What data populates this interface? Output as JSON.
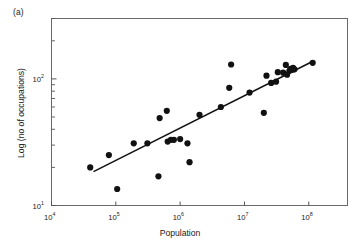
{
  "figure": {
    "panel_label": "(a)"
  },
  "chart_data": {
    "type": "scatter",
    "title": "",
    "xlabel": "Population",
    "ylabel": "Log (no of occupations)",
    "xscale": "log",
    "yscale": "log",
    "xlim": [
      10000,
      400000000
    ],
    "ylim": [
      10,
      300
    ],
    "grid": false,
    "legend": null,
    "xticks": [
      {
        "value": 10000,
        "mantissa": "10",
        "exponent": "4",
        "label": "10^4"
      },
      {
        "value": 100000,
        "mantissa": "10",
        "exponent": "5",
        "label": "10^5"
      },
      {
        "value": 1000000,
        "mantissa": "10",
        "exponent": "6",
        "label": "10^6"
      },
      {
        "value": 10000000,
        "mantissa": "10",
        "exponent": "7",
        "label": "10^7"
      },
      {
        "value": 100000000,
        "mantissa": "10",
        "exponent": "8",
        "label": "10^8"
      }
    ],
    "yticks": [
      {
        "value": 10,
        "mantissa": "10",
        "exponent": "1",
        "label": "10^1"
      },
      {
        "value": 100,
        "mantissa": "10",
        "exponent": "2",
        "label": "10^2"
      }
    ],
    "points": [
      {
        "x": 40000,
        "y": 20
      },
      {
        "x": 78000,
        "y": 25
      },
      {
        "x": 105000,
        "y": 13.5
      },
      {
        "x": 190000,
        "y": 31
      },
      {
        "x": 310000,
        "y": 31
      },
      {
        "x": 460000,
        "y": 17
      },
      {
        "x": 480000,
        "y": 49
      },
      {
        "x": 620000,
        "y": 56
      },
      {
        "x": 640000,
        "y": 32
      },
      {
        "x": 720000,
        "y": 33
      },
      {
        "x": 800000,
        "y": 33
      },
      {
        "x": 1000000,
        "y": 33.5
      },
      {
        "x": 1300000,
        "y": 31
      },
      {
        "x": 1400000,
        "y": 22
      },
      {
        "x": 2000000,
        "y": 52
      },
      {
        "x": 4300000,
        "y": 60
      },
      {
        "x": 5800000,
        "y": 85
      },
      {
        "x": 6200000,
        "y": 130
      },
      {
        "x": 12000000,
        "y": 78
      },
      {
        "x": 20000000,
        "y": 54
      },
      {
        "x": 22000000,
        "y": 106
      },
      {
        "x": 26000000,
        "y": 93
      },
      {
        "x": 31000000,
        "y": 95
      },
      {
        "x": 33000000,
        "y": 113
      },
      {
        "x": 40000000,
        "y": 112
      },
      {
        "x": 44000000,
        "y": 129
      },
      {
        "x": 46000000,
        "y": 108
      },
      {
        "x": 50000000,
        "y": 116
      },
      {
        "x": 52000000,
        "y": 120
      },
      {
        "x": 55000000,
        "y": 118
      },
      {
        "x": 57000000,
        "y": 122
      },
      {
        "x": 60000000,
        "y": 119
      },
      {
        "x": 115000000,
        "y": 134
      }
    ],
    "trendline": {
      "type": "linear-in-log-log",
      "x_start": 45000,
      "y_start": 18.5,
      "x_end": 110000000,
      "y_end": 136
    },
    "marker": {
      "shape": "circle",
      "color": "#111111",
      "size": 4.4
    },
    "line_color": "#111111",
    "axis_color": "#555555"
  }
}
